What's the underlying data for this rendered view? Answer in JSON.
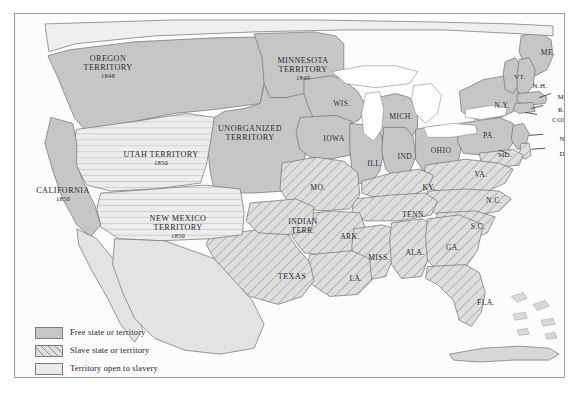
{
  "map": {
    "title": "The United States in 1850 — Slavery Status Map",
    "colors": {
      "free": "#c6c6c6",
      "slave_base": "#dedede",
      "slave_hatch": "#8f8f8f",
      "open": "#ebebeb",
      "water": "#ffffff",
      "border": "#9a9a9a",
      "outline": "#7d7d7d",
      "text": "#1b1b1b",
      "page_background": "#ffffff"
    },
    "territories": [
      {
        "name": "OREGON\nTERRITORY",
        "year": "1848",
        "status": "free",
        "x": 88,
        "y": 54
      },
      {
        "name": "MINNESOTA\nTERRITORY",
        "year": "1849",
        "status": "free",
        "x": 283,
        "y": 56
      },
      {
        "name": "UNORGANIZED\nTERRITORY",
        "year": "",
        "status": "free",
        "x": 228,
        "y": 124
      },
      {
        "name": "UTAH TERRITORY",
        "year": "1850",
        "status": "open",
        "x": 141,
        "y": 147
      },
      {
        "name": "NEW MEXICO\nTERRITORY",
        "year": "1850",
        "status": "open",
        "x": 163,
        "y": 218
      },
      {
        "name": "CALIFORNIA",
        "year": "1850",
        "status": "free",
        "x": 47,
        "y": 186
      },
      {
        "name": "INDIAN\nTERR.",
        "year": "",
        "status": "slave",
        "x": 289,
        "y": 218
      },
      {
        "name": "TEXAS",
        "year": "",
        "status": "slave",
        "x": 277,
        "y": 268
      }
    ],
    "states": [
      {
        "label": "WIS.",
        "status": "free",
        "x": 327,
        "y": 96
      },
      {
        "label": "MICH.",
        "status": "free",
        "x": 384,
        "y": 109
      },
      {
        "label": "IOWA",
        "status": "free",
        "x": 318,
        "y": 131
      },
      {
        "label": "ILL.",
        "status": "free",
        "x": 360,
        "y": 155
      },
      {
        "label": "IND.",
        "status": "free",
        "x": 391,
        "y": 149
      },
      {
        "label": "OHIO",
        "status": "free",
        "x": 425,
        "y": 143
      },
      {
        "label": "PA.",
        "status": "free",
        "x": 474,
        "y": 128
      },
      {
        "label": "N.Y.",
        "status": "free",
        "x": 487,
        "y": 97
      },
      {
        "label": "ME.",
        "status": "free",
        "x": 533,
        "y": 45
      },
      {
        "label": "VT.",
        "status": "free",
        "x": 505,
        "y": 69
      },
      {
        "label": "N.H.",
        "status": "free",
        "x": 525,
        "y": 78
      },
      {
        "label": "MASS.",
        "status": "free",
        "x": 552,
        "y": 89
      },
      {
        "label": "R.I.",
        "status": "free",
        "x": 548,
        "y": 102
      },
      {
        "label": "CONN.",
        "status": "free",
        "x": 548,
        "y": 112
      },
      {
        "label": "N.J.",
        "status": "free",
        "x": 549,
        "y": 131
      },
      {
        "label": "DEL.",
        "status": "slave",
        "x": 551,
        "y": 146
      },
      {
        "label": "MD.",
        "status": "slave",
        "x": 489,
        "y": 147
      },
      {
        "label": "MO.",
        "status": "slave",
        "x": 302,
        "y": 180
      },
      {
        "label": "VA.",
        "status": "slave",
        "x": 465,
        "y": 167
      },
      {
        "label": "KY.",
        "status": "slave",
        "x": 413,
        "y": 180
      },
      {
        "label": "N.C.",
        "status": "slave",
        "x": 478,
        "y": 193
      },
      {
        "label": "TENN.",
        "status": "slave",
        "x": 398,
        "y": 207
      },
      {
        "label": "ARK.",
        "status": "slave",
        "x": 334,
        "y": 229
      },
      {
        "label": "S.C.",
        "status": "slave",
        "x": 462,
        "y": 219
      },
      {
        "label": "MISS.",
        "status": "slave",
        "x": 363,
        "y": 250
      },
      {
        "label": "ALA.",
        "status": "slave",
        "x": 399,
        "y": 245
      },
      {
        "label": "GA.",
        "status": "slave",
        "x": 437,
        "y": 240
      },
      {
        "label": "LA.",
        "status": "slave",
        "x": 340,
        "y": 271
      },
      {
        "label": "FLA.",
        "status": "slave",
        "x": 470,
        "y": 295
      }
    ],
    "legend": {
      "items": [
        {
          "swatch": "free",
          "label": "Free state or territory"
        },
        {
          "swatch": "slave",
          "label": "Slave state or territory"
        },
        {
          "swatch": "open",
          "label": "Territory open to slavery"
        }
      ]
    }
  }
}
